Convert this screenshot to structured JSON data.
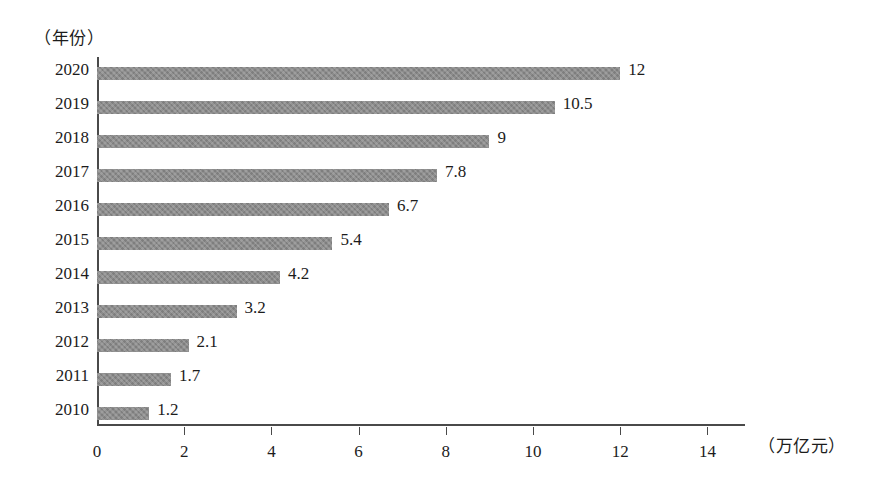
{
  "chart_data": {
    "type": "bar",
    "orientation": "horizontal",
    "title": "",
    "subtitle": "",
    "xlabel": "（万亿元）",
    "ylabel": "（年份）",
    "categories": [
      "2020",
      "2019",
      "2018",
      "2017",
      "2016",
      "2015",
      "2014",
      "2013",
      "2012",
      "2011",
      "2010"
    ],
    "values": [
      12,
      10.5,
      9,
      7.8,
      6.7,
      5.4,
      4.2,
      3.2,
      2.1,
      1.7,
      1.2
    ],
    "value_labels": [
      "12",
      "10.5",
      "9",
      "7.8",
      "6.7",
      "5.4",
      "4.2",
      "3.2",
      "2.1",
      "1.7",
      "1.2"
    ],
    "xlim": [
      0,
      14
    ],
    "xticks": [
      0,
      2,
      4,
      6,
      8,
      10,
      12,
      14
    ],
    "xtick_labels": [
      "0",
      "2",
      "4",
      "6",
      "8",
      "10",
      "12",
      "14"
    ],
    "grid": false,
    "legend": null,
    "series": [
      {
        "name": "",
        "values": [
          12,
          10.5,
          9,
          7.8,
          6.7,
          5.4,
          4.2,
          3.2,
          2.1,
          1.7,
          1.2
        ]
      }
    ],
    "colors": {
      "bar": "#8c8c8c",
      "axis": "#4a4a4a",
      "text": "#1c1c1c",
      "background": "#ffffff"
    }
  }
}
